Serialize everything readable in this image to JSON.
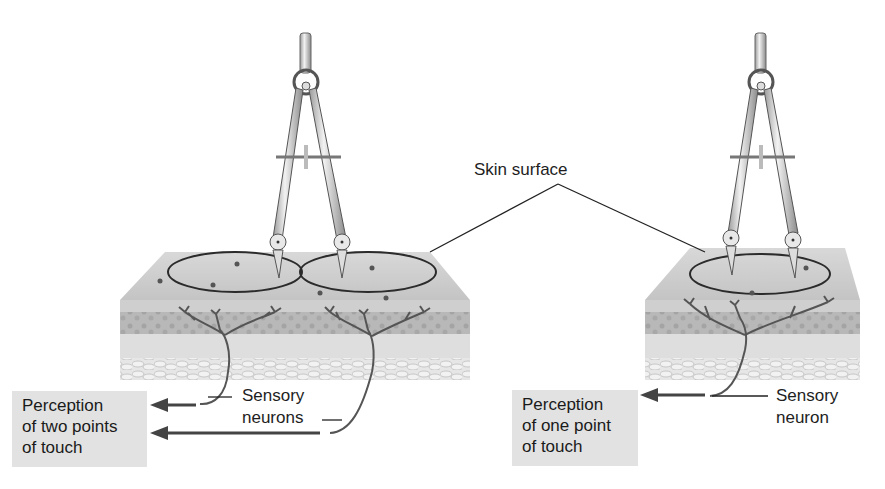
{
  "figure": {
    "labels": {
      "skin_surface": "Skin surface",
      "left_neuron_label": [
        "Sensory",
        "neurons"
      ],
      "right_neuron_label": [
        "Sensory",
        "neuron"
      ]
    },
    "left_panel": {
      "perception_box": [
        "Perception",
        "of two points",
        "of touch"
      ],
      "receptive_fields": 2,
      "caliper_points": 2
    },
    "right_panel": {
      "perception_box": [
        "Perception",
        "of one point",
        "of touch"
      ],
      "receptive_fields": 1,
      "caliper_points": 2
    },
    "colors": {
      "box_fill": "#e2e2e2",
      "skin_top": "#c9c9c9",
      "dermis": "#dcdcdc",
      "neuron": "#555555",
      "arrow": "#444444"
    }
  }
}
